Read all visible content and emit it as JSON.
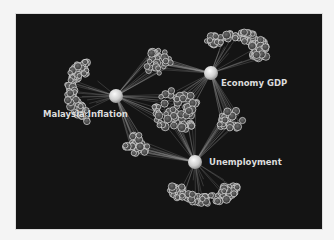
{
  "diagram": {
    "type": "network",
    "background_color": "#141414",
    "page_color": "#f4f4f4",
    "hubs": [
      {
        "id": "inflation",
        "label": "Malaysia Inflation"
      },
      {
        "id": "gdp",
        "label": "Economy GDP"
      },
      {
        "id": "unemployment",
        "label": "Unemployment"
      }
    ],
    "clusters": [
      {
        "id": "c-inflation-outer",
        "connects": [
          "inflation"
        ],
        "shape": "fan"
      },
      {
        "id": "c-gdp-outer",
        "connects": [
          "gdp"
        ],
        "shape": "fan"
      },
      {
        "id": "c-unemployment-outer",
        "connects": [
          "unemployment"
        ],
        "shape": "fan"
      },
      {
        "id": "c-inflation-gdp",
        "connects": [
          "inflation",
          "gdp"
        ],
        "shape": "ball"
      },
      {
        "id": "c-gdp-unemployment",
        "connects": [
          "gdp",
          "unemployment"
        ],
        "shape": "ball"
      },
      {
        "id": "c-inflation-unemployment",
        "connects": [
          "inflation",
          "unemployment"
        ],
        "shape": "ball"
      },
      {
        "id": "c-center",
        "connects": [
          "inflation",
          "gdp",
          "unemployment"
        ],
        "shape": "ball-large"
      }
    ]
  }
}
